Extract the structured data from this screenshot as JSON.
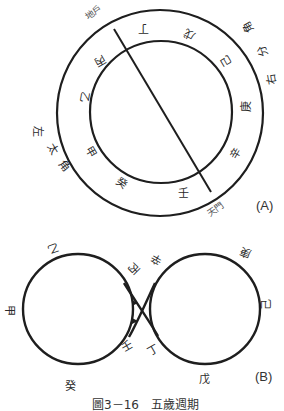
{
  "diagram_a": {
    "tag": "(A)",
    "outer_labels": {
      "dihu": "地戶",
      "tianmen": "天門",
      "left": [
        "左",
        "太",
        "角"
      ],
      "right": [
        "角",
        "分",
        "右"
      ]
    },
    "stems": {
      "ding": "丁",
      "wu": "戊",
      "ji": "己",
      "geng": "庚",
      "xin": "辛",
      "ren": "壬",
      "gui": "癸",
      "jia": "甲",
      "yi": "乙",
      "bing": "丙"
    }
  },
  "diagram_b": {
    "tag": "(B)",
    "stems": {
      "yi": "乙",
      "jia": "甲",
      "gui": "癸",
      "bing": "丙",
      "ren": "壬",
      "xin": "辛",
      "ding": "丁",
      "geng": "庚",
      "ji": "己",
      "wu": "戊"
    }
  },
  "caption": "圖3－16　五歲週期"
}
